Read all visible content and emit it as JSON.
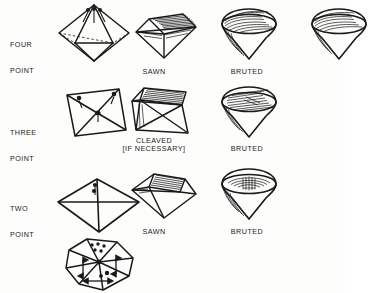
{
  "page": {
    "background_color": "#fdfdfc",
    "ink_color": "#1a1a1a",
    "width": 345,
    "height": 293
  },
  "row_labels": [
    {
      "id": "four-point",
      "line1": "FOUR",
      "line2": "POINT",
      "x": 10,
      "y": 24
    },
    {
      "id": "three-point",
      "line1": "THREE",
      "line2": "POINT",
      "x": 10,
      "y": 112
    },
    {
      "id": "two-point",
      "line1": "TWO",
      "line2": "POINT",
      "x": 10,
      "y": 188
    }
  ],
  "stage_labels": [
    {
      "id": "sawn-top",
      "text": "SAWN",
      "x": 154,
      "y": 68
    },
    {
      "id": "bruted-top",
      "text": "BRUTED",
      "x": 247,
      "y": 68
    },
    {
      "id": "cleaved",
      "text": "CLEAVED",
      "x": 154,
      "y": 137
    },
    {
      "id": "cleaved-note",
      "text": "[IF NECESSARY]",
      "x": 154,
      "y": 145
    },
    {
      "id": "sawn-bottom",
      "text": "SAWN",
      "x": 154,
      "y": 228
    },
    {
      "id": "bruted-middle",
      "text": "BRUTED",
      "x": 247,
      "y": 145
    },
    {
      "id": "bruted-bottom",
      "text": "BRUTED",
      "x": 247,
      "y": 228
    }
  ],
  "figures": [
    {
      "id": "octahedron-four-point",
      "kind": "rough-octahedron",
      "row": "four-point",
      "stage": "rough",
      "x": 55,
      "y": 2,
      "w": 78,
      "h": 62
    },
    {
      "id": "sawn-four-point",
      "kind": "sawn-stone",
      "row": "four-point",
      "stage": "sawn",
      "x": 131,
      "y": 6,
      "w": 70,
      "h": 54
    },
    {
      "id": "bruted-four-point",
      "kind": "bruted-stone",
      "row": "four-point",
      "stage": "bruted",
      "x": 216,
      "y": 6,
      "w": 66,
      "h": 54
    },
    {
      "id": "bruted-four-point-edge",
      "kind": "bruted-stone-clipped",
      "row": "four-point",
      "stage": "bruted",
      "x": 306,
      "y": 6,
      "w": 66,
      "h": 54
    },
    {
      "id": "macle-three-point",
      "kind": "flat-macle",
      "row": "three-point",
      "stage": "rough",
      "x": 62,
      "y": 86,
      "w": 68,
      "h": 58
    },
    {
      "id": "cleaved-three-point",
      "kind": "cleaved-stone",
      "row": "three-point",
      "stage": "cleaved",
      "x": 126,
      "y": 86,
      "w": 70,
      "h": 48
    },
    {
      "id": "bruted-three-point",
      "kind": "bruted-stone",
      "row": "three-point",
      "stage": "bruted",
      "x": 216,
      "y": 84,
      "w": 66,
      "h": 54
    },
    {
      "id": "octahedron-two-point",
      "kind": "rough-octahedron-flat",
      "row": "two-point",
      "stage": "rough",
      "x": 55,
      "y": 176,
      "w": 86,
      "h": 58
    },
    {
      "id": "sawn-two-point",
      "kind": "sawn-stone-angled",
      "row": "two-point",
      "stage": "sawn",
      "x": 128,
      "y": 170,
      "w": 72,
      "h": 52
    },
    {
      "id": "bruted-two-point",
      "kind": "bruted-stone",
      "row": "two-point",
      "stage": "bruted",
      "x": 216,
      "y": 166,
      "w": 66,
      "h": 54
    },
    {
      "id": "octahedron-grain-directions",
      "kind": "octahedron-with-arrows",
      "row": "bottom",
      "stage": "grain",
      "x": 57,
      "y": 236,
      "w": 84,
      "h": 56
    }
  ]
}
